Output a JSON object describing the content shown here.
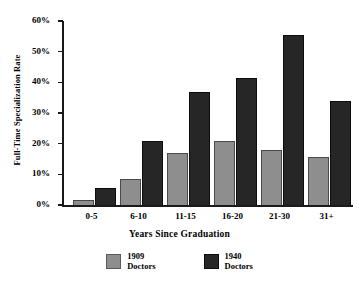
{
  "chart_data": {
    "type": "bar",
    "title": "",
    "xlabel": "Years Since Graduation",
    "ylabel": "Full-Time Specialization Rate",
    "categories": [
      "0-5",
      "6-10",
      "11-15",
      "16-20",
      "21-30",
      "31+"
    ],
    "series": [
      {
        "name": "1909 Doctors",
        "values": [
          1.5,
          8.5,
          17,
          21,
          18,
          15.5
        ],
        "color": "#8e8e8e"
      },
      {
        "name": "1940 Doctors",
        "values": [
          5.5,
          21,
          37,
          41.5,
          55.5,
          34
        ],
        "color": "#262626"
      }
    ],
    "ylim": [
      0,
      60
    ],
    "ytick_values": [
      0,
      10,
      20,
      30,
      40,
      50,
      60
    ],
    "ytick_labels": [
      "0%",
      "10%",
      "20%",
      "30%",
      "40%",
      "50%",
      "60%"
    ],
    "grid": false,
    "legend_position": "bottom"
  },
  "legend": {
    "items": [
      {
        "label": "1909\nDoctors"
      },
      {
        "label": "1940\nDoctors"
      }
    ]
  }
}
